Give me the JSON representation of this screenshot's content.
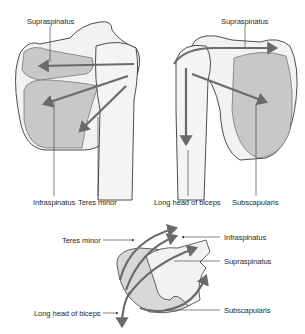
{
  "figure": {
    "panels": [
      {
        "id": "posterior-view",
        "labels": {
          "top": "Supraspinatus",
          "bottom_left": "Infraspinatus",
          "bottom_right": "Teres minor"
        }
      },
      {
        "id": "anterior-view",
        "labels": {
          "top": "Supraspinatus",
          "bottom_left": "Long head of biceps",
          "bottom_right": "Subscapularis"
        }
      },
      {
        "id": "superior-view",
        "labels": {
          "left_top": "Teres minor",
          "left_bottom": "Long head of biceps",
          "right_1": "Infraspinatus",
          "right_2": "Supraspinatus",
          "right_3": "Subscapularis"
        }
      }
    ],
    "colors": {
      "bone_fill": "#f2f2f2",
      "muscle_fill": "#c8c8c8",
      "outline": "#3a3a3a",
      "arrow": "#6a6a6a",
      "leader": "#333333"
    }
  }
}
